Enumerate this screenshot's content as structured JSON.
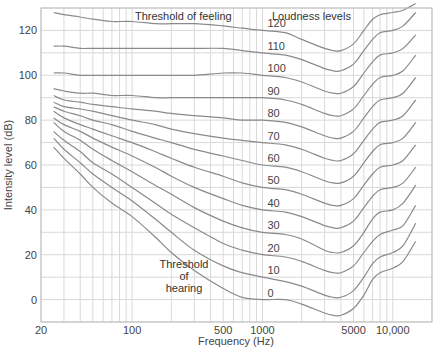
{
  "chart_data": {
    "type": "line",
    "title": "",
    "xlabel": "Frequency (Hz)",
    "ylabel": "Intensity level (dB)",
    "xscale": "log",
    "xlim": [
      20,
      20000
    ],
    "ylim": [
      -10,
      130
    ],
    "grid": true,
    "x_tick_labels": [
      {
        "value": 20,
        "label": "20"
      },
      {
        "value": 100,
        "label": "100"
      },
      {
        "value": 500,
        "label": "500"
      },
      {
        "value": 1000,
        "label": "1000"
      },
      {
        "value": 5000,
        "label": "5000"
      },
      {
        "value": 10000,
        "label": "10,000"
      }
    ],
    "y_tick_labels": [
      {
        "value": 0,
        "label": "0"
      },
      {
        "value": 20,
        "label": "20"
      },
      {
        "value": 40,
        "label": "40"
      },
      {
        "value": 60,
        "label": "60"
      },
      {
        "value": 80,
        "label": "80"
      },
      {
        "value": 100,
        "label": "100"
      },
      {
        "value": 120,
        "label": "120"
      }
    ],
    "x_gridlines": [
      20,
      30,
      40,
      50,
      60,
      70,
      80,
      90,
      100,
      200,
      300,
      400,
      500,
      600,
      700,
      800,
      900,
      1000,
      2000,
      3000,
      4000,
      5000,
      6000,
      7000,
      8000,
      9000,
      10000,
      20000
    ],
    "y_gridlines": [
      -10,
      0,
      10,
      20,
      30,
      40,
      50,
      60,
      70,
      80,
      90,
      100,
      110,
      120,
      130
    ],
    "annotations": [
      {
        "text": "Threshold of feeling",
        "x_px": 135,
        "y_px": 20
      },
      {
        "text": "Loudness levels",
        "x_px": 272,
        "y_px": 20
      },
      {
        "text": "Threshold",
        "x_px": 184,
        "y_px": 268
      },
      {
        "text": "of",
        "x_px": 184,
        "y_px": 280
      },
      {
        "text": "hearing",
        "x_px": 184,
        "y_px": 292
      }
    ],
    "label_x_freq": 1000,
    "series_x": [
      25,
      30,
      40,
      50,
      70,
      100,
      150,
      200,
      300,
      500,
      700,
      1000,
      1500,
      2000,
      3000,
      3500,
      4000,
      5000,
      6000,
      7000,
      8000,
      10000,
      12000,
      15000
    ],
    "series": [
      {
        "name": "0",
        "label": "0",
        "values": [
          68,
          63,
          56,
          50,
          43,
          37,
          28,
          21,
          13,
          5,
          1,
          0,
          0,
          -2,
          -6,
          -7,
          -7,
          -4,
          2,
          9,
          12,
          14,
          17,
          26
        ]
      },
      {
        "name": "10",
        "label": "10",
        "values": [
          72,
          67,
          61,
          56,
          50,
          44,
          36,
          30,
          22,
          15,
          12,
          10,
          8,
          6,
          2,
          1,
          1,
          4,
          10,
          16,
          19,
          21,
          24,
          34
        ]
      },
      {
        "name": "20",
        "label": "20",
        "values": [
          75,
          71,
          66,
          61,
          56,
          50,
          43,
          38,
          32,
          25,
          22,
          20,
          19,
          17,
          13,
          12,
          12,
          15,
          21,
          26,
          29,
          31,
          33,
          42
        ]
      },
      {
        "name": "30",
        "label": "30",
        "values": [
          79,
          75,
          71,
          67,
          62,
          57,
          51,
          47,
          41,
          35,
          32,
          30,
          29,
          27,
          22,
          21,
          21,
          24,
          30,
          36,
          39,
          40,
          43,
          51
        ]
      },
      {
        "name": "40",
        "label": "40",
        "values": [
          81,
          78,
          75,
          72,
          68,
          64,
          59,
          55,
          50,
          45,
          42,
          40,
          39,
          37,
          33,
          32,
          32,
          35,
          41,
          46,
          49,
          50,
          52,
          59
        ]
      },
      {
        "name": "50",
        "label": "50",
        "values": [
          84,
          81,
          78,
          76,
          73,
          70,
          66,
          63,
          59,
          55,
          52,
          50,
          49,
          47,
          43,
          42,
          42,
          45,
          51,
          56,
          59,
          60,
          62,
          69
        ]
      },
      {
        "name": "60",
        "label": "60",
        "values": [
          86,
          84,
          82,
          80,
          78,
          75,
          72,
          70,
          67,
          64,
          62,
          60,
          59,
          57,
          53,
          52,
          52,
          55,
          61,
          66,
          69,
          70,
          72,
          79
        ]
      },
      {
        "name": "70",
        "label": "70",
        "values": [
          88,
          86,
          85,
          84,
          82,
          80,
          78,
          76,
          74,
          72,
          71,
          70,
          69,
          67,
          63,
          62,
          62,
          65,
          71,
          76,
          79,
          80,
          82,
          89
        ]
      },
      {
        "name": "80",
        "label": "80",
        "values": [
          91,
          89,
          88,
          87,
          86,
          85,
          84,
          83,
          82,
          81,
          80,
          80,
          79,
          77,
          73,
          72,
          72,
          75,
          81,
          86,
          89,
          90,
          92,
          99
        ]
      },
      {
        "name": "90",
        "label": "90",
        "values": [
          94,
          93,
          92,
          92,
          91,
          91,
          90,
          90,
          90,
          90,
          90,
          90,
          89,
          87,
          83,
          82,
          82,
          85,
          91,
          96,
          99,
          100,
          102,
          109
        ]
      },
      {
        "name": "100",
        "label": "100",
        "values": [
          101,
          101,
          100,
          100,
          100,
          100,
          100,
          100,
          100,
          101,
          101,
          100,
          99,
          97,
          93,
          92,
          92,
          95,
          101,
          106,
          109,
          110,
          112,
          118
        ]
      },
      {
        "name": "110",
        "label": "110",
        "values": [
          113,
          113,
          112,
          112,
          112,
          112,
          112,
          112,
          112,
          112,
          111,
          110,
          109,
          107,
          103,
          102,
          102,
          105,
          111,
          116,
          119,
          120,
          122,
          128
        ]
      },
      {
        "name": "120",
        "label": "120",
        "values": [
          128,
          127,
          126,
          125,
          124,
          124,
          123,
          123,
          123,
          122,
          121,
          120,
          119,
          116,
          112,
          111,
          111,
          114,
          120,
          125,
          127,
          128,
          129,
          132
        ]
      }
    ],
    "colors": {
      "curve": "#8a8a8a",
      "grid": "#d9d9d9",
      "axis": "#bdbdbd",
      "text": "#444444"
    }
  }
}
